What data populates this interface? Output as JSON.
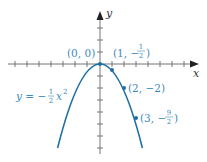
{
  "diagram": {
    "axes": {
      "x_label": "x",
      "y_label": "y"
    },
    "equation": {
      "lhs": "y = −",
      "frac_num": "1",
      "frac_den": "2",
      "var": "x",
      "exp": "2"
    },
    "points": [
      {
        "label_main": "(0, 0)",
        "x": 0,
        "y": 0
      },
      {
        "label_pre": "(1, −",
        "frac_num": "1",
        "frac_den": "2",
        "label_post": ")",
        "x": 1,
        "y": -0.5
      },
      {
        "label_main": "(2, −2)",
        "x": 2,
        "y": -2
      },
      {
        "label_pre": "(3, −",
        "frac_num": "9",
        "frac_den": "2",
        "label_post": ")",
        "x": 3,
        "y": -4.5
      }
    ],
    "colors": {
      "curve": "#1f6fa3",
      "label": "#3f8bbd",
      "axis": "#555555"
    }
  }
}
